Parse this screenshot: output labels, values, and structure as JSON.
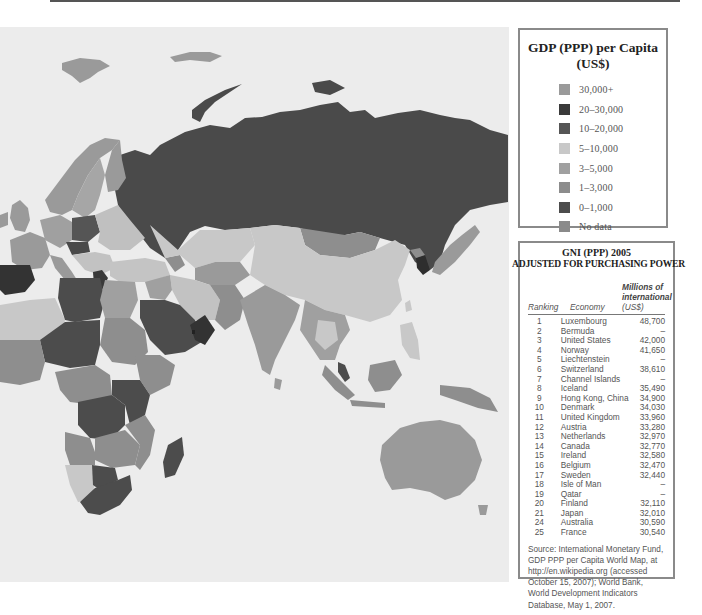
{
  "map": {
    "title": "GDP (PPP) per Capita World Map - Eastern Hemisphere",
    "colors": {
      "ocean": "#ececec",
      "over_30000": "#9a9a9a",
      "c20_30000": "#3a3a3a",
      "c10_20000": "#555555",
      "c5_10000": "#c8c8c8",
      "c3_5000": "#a3a3a3",
      "c1_3000": "#8e8e8e",
      "c0_1000": "#4c4c4c",
      "no_data": "#8a8a8a"
    },
    "regions": [
      {
        "name": "Russia",
        "category": "5-10,000 (shown dark)"
      },
      {
        "name": "China",
        "category": "5-10,000"
      },
      {
        "name": "Australia",
        "category": "30,000+"
      },
      {
        "name": "Saudi Arabia",
        "category": "10-20,000"
      },
      {
        "name": "South Korea",
        "category": "20-30,000"
      },
      {
        "name": "Spain",
        "category": "20-30,000"
      },
      {
        "name": "Madagascar",
        "category": "0-1,000"
      }
    ]
  },
  "legend": {
    "title_line1": "GDP (PPP) per Capita",
    "title_line2": "(US$)",
    "items": [
      {
        "label": "30,000+",
        "color": "#9a9a9a"
      },
      {
        "label": "20–30,000",
        "color": "#3a3a3a"
      },
      {
        "label": "10–20,000",
        "color": "#555555"
      },
      {
        "label": "5–10,000",
        "color": "#c8c8c8"
      },
      {
        "label": "3–5,000",
        "color": "#a0a0a0"
      },
      {
        "label": "1–3,000",
        "color": "#8c8c8c"
      },
      {
        "label": "0–1,000",
        "color": "#4c4c4c"
      },
      {
        "label": "No data",
        "color": "#8a8a8a"
      }
    ]
  },
  "table": {
    "title_line1": "GNI (PPP) 2005",
    "title_line2": "ADJUSTED FOR PURCHASING POWER",
    "headers": {
      "ranking": "Ranking",
      "economy": "Economy",
      "value_line1": "Millions of",
      "value_line2": "international",
      "value_line3": "(US$)"
    },
    "rows": [
      {
        "rank": "1",
        "economy": "Luxembourg",
        "value": "48,700"
      },
      {
        "rank": "2",
        "economy": "Bermuda",
        "value": "–"
      },
      {
        "rank": "3",
        "economy": "United States",
        "value": "42,000"
      },
      {
        "rank": "4",
        "economy": "Norway",
        "value": "41,650"
      },
      {
        "rank": "5",
        "economy": "Liechtenstein",
        "value": "–"
      },
      {
        "rank": "6",
        "economy": "Switzerland",
        "value": "38,610"
      },
      {
        "rank": "7",
        "economy": "Channel Islands",
        "value": "–"
      },
      {
        "rank": "8",
        "economy": "Iceland",
        "value": "35,490"
      },
      {
        "rank": "9",
        "economy": "Hong Kong, China",
        "value": "34,900"
      },
      {
        "rank": "10",
        "economy": "Denmark",
        "value": "34,030"
      },
      {
        "rank": "11",
        "economy": "United Kingdom",
        "value": "33,960"
      },
      {
        "rank": "12",
        "economy": "Austria",
        "value": "33,280"
      },
      {
        "rank": "13",
        "economy": "Netherlands",
        "value": "32,970"
      },
      {
        "rank": "14",
        "economy": "Canada",
        "value": "32,770"
      },
      {
        "rank": "15",
        "economy": "Ireland",
        "value": "32,580"
      },
      {
        "rank": "16",
        "economy": "Belgium",
        "value": "32,470"
      },
      {
        "rank": "17",
        "economy": "Sweden",
        "value": "32,440"
      },
      {
        "rank": "18",
        "economy": "Isle of Man",
        "value": "–"
      },
      {
        "rank": "19",
        "economy": "Qatar",
        "value": "–"
      },
      {
        "rank": "20",
        "economy": "Finland",
        "value": "32,110"
      },
      {
        "rank": "21",
        "economy": "Japan",
        "value": "32,010"
      },
      {
        "rank": "24",
        "economy": "Australia",
        "value": "30,590"
      },
      {
        "rank": "25",
        "economy": "France",
        "value": "30,540"
      }
    ],
    "source": "Source: International Monetary Fund, GDP PPP per Capita World Map, at http://en.wikipedia.org (accessed October 15, 2007); World Bank, World Development Indicators Database, May 1, 2007."
  }
}
